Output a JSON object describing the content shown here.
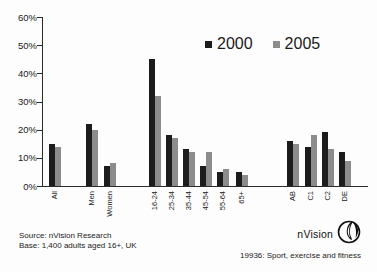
{
  "chart_data": {
    "type": "bar",
    "categories": [
      "All",
      "Men",
      "Women",
      "16-24",
      "25-34",
      "35-44",
      "45-54",
      "55-64",
      "65+",
      "AB",
      "C1",
      "C2",
      "DE"
    ],
    "series": [
      {
        "name": "2000",
        "color": "#1c1c1c",
        "values": [
          15,
          22,
          7,
          45,
          18,
          13,
          7,
          5,
          5,
          16,
          14,
          19,
          12
        ]
      },
      {
        "name": "2005",
        "color": "#8c8c8c",
        "values": [
          14,
          20,
          8,
          32,
          17,
          12,
          12,
          6,
          4,
          15,
          18,
          13,
          9
        ]
      }
    ],
    "title": "",
    "xlabel": "",
    "ylabel": "",
    "ylim": [
      0,
      60
    ],
    "y_ticks": [
      "60%",
      "50%",
      "40%",
      "30%",
      "20%",
      "10%",
      "0%"
    ],
    "grid": false,
    "legend_position": "top-center"
  },
  "footer": {
    "source_line1": "Source: nVision Research",
    "source_line2": "Base: 1,400 adults aged 16+, UK",
    "brand": "nVision",
    "caption": "19936: Sport, exercise and fitness"
  }
}
